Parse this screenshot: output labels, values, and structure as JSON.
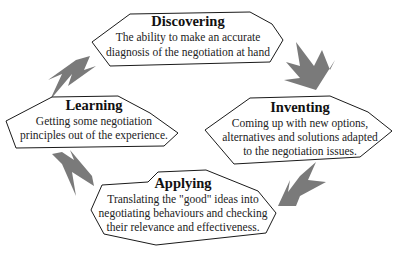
{
  "diagram": {
    "type": "cycle",
    "stages": [
      {
        "id": "discovering",
        "title": "Discovering",
        "lines": [
          "The ability to make an accurate",
          "diagnosis of the negotiation at hand"
        ]
      },
      {
        "id": "inventing",
        "title": "Inventing",
        "lines": [
          "Coming up with new options,",
          "alternatives and solutions adapted",
          "to the negotiation issues."
        ]
      },
      {
        "id": "applying",
        "title": "Applying",
        "lines": [
          "Translating the \"good\" ideas into",
          "negotiating behaviours and checking",
          "their relevance and effectiveness."
        ]
      },
      {
        "id": "learning",
        "title": "Learning",
        "lines": [
          "Getting some negotiation",
          "principles out of the experience."
        ]
      }
    ],
    "arrows": [
      {
        "from": "discovering",
        "to": "inventing",
        "icon": "arrow-icon"
      },
      {
        "from": "inventing",
        "to": "applying",
        "icon": "arrow-icon"
      },
      {
        "from": "applying",
        "to": "learning",
        "icon": "arrow-icon"
      },
      {
        "from": "learning",
        "to": "discovering",
        "icon": "arrow-icon"
      }
    ],
    "colors": {
      "arrow": "#7a7a7a",
      "outline": "#1a1a1a",
      "text": "#111111"
    }
  }
}
